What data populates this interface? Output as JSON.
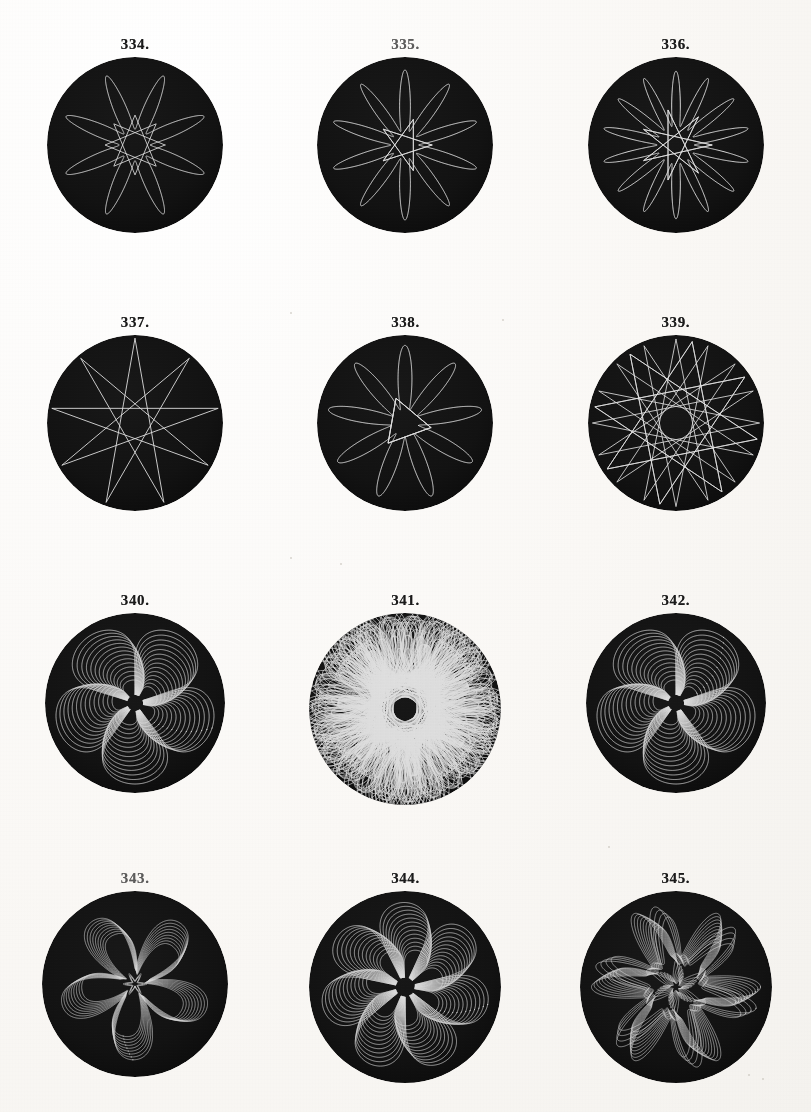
{
  "plate": {
    "title": "Plate of geometric chuck turned patterns, figures 334 to 345",
    "paper_color": "#fbfaf7",
    "ink_color": "#1b1b1b",
    "disc_color": "#171413",
    "line_color": "#e8e5dd",
    "columns": 3,
    "rows": 4
  },
  "figures": [
    {
      "label": "334.",
      "number": 334,
      "row": 1,
      "col": 1,
      "disc_diameter": 176,
      "pattern": "rosette",
      "petals": 8,
      "inner_ratio": 0.2,
      "petal_width": 0.36,
      "line_width": 1.0,
      "copies": 1,
      "copy_offset": 0,
      "rotation": 0,
      "outer_ratio": 0.92,
      "faded_label": false
    },
    {
      "label": "335.",
      "number": 335,
      "row": 1,
      "col": 2,
      "disc_diameter": 176,
      "pattern": "rosette",
      "petals": 10,
      "inner_ratio": 0.18,
      "petal_width": 0.3,
      "line_width": 1.0,
      "copies": 1,
      "copy_offset": 0,
      "rotation": 0,
      "outer_ratio": 0.92,
      "faded_label": true
    },
    {
      "label": "336.",
      "number": 336,
      "row": 1,
      "col": 3,
      "disc_diameter": 176,
      "pattern": "rosette",
      "petals": 14,
      "inner_ratio": 0.24,
      "petal_width": 0.24,
      "line_width": 1.0,
      "copies": 1,
      "copy_offset": 0,
      "rotation": 0,
      "outer_ratio": 0.92,
      "faded_label": false
    },
    {
      "label": "337.",
      "number": 337,
      "row": 2,
      "col": 1,
      "disc_diameter": 176,
      "pattern": "star",
      "points": 9,
      "inner_ratio": 0.13,
      "petal_width": 0.07,
      "line_width": 0.9,
      "copies": 1,
      "copy_offset": 0,
      "rotation": 0,
      "outer_ratio": 0.96,
      "faded_label": false
    },
    {
      "label": "338.",
      "number": 338,
      "row": 2,
      "col": 2,
      "disc_diameter": 176,
      "pattern": "rosette",
      "petals": 9,
      "inner_ratio": 0.17,
      "petal_width": 0.16,
      "line_width": 1.0,
      "copies": 1,
      "copy_offset": 0,
      "rotation": 10,
      "outer_ratio": 0.95,
      "faded_label": false
    },
    {
      "label": "339.",
      "number": 339,
      "row": 2,
      "col": 3,
      "disc_diameter": 176,
      "pattern": "star",
      "points": 16,
      "inner_ratio": 0.19,
      "petal_width": 0.05,
      "line_width": 0.85,
      "copies": 1,
      "copy_offset": 0,
      "rotation": 0,
      "outer_ratio": 0.95,
      "faded_label": false
    },
    {
      "label": "340.",
      "number": 340,
      "row": 3,
      "col": 1,
      "disc_diameter": 180,
      "pattern": "spiral-lobe",
      "petals": 5,
      "inner_ratio": 0.1,
      "petal_width": 0.52,
      "line_width": 0.75,
      "copies": 14,
      "copy_offset": 2.2,
      "rotation": 18,
      "outer_ratio": 0.9,
      "faded_label": false
    },
    {
      "label": "341.",
      "number": 341,
      "row": 3,
      "col": 2,
      "disc_diameter": 192,
      "pattern": "dense-rose",
      "petals": 17,
      "inner_ratio": 0.07,
      "petal_width": 0.62,
      "line_width": 0.7,
      "copies": 17,
      "copy_offset": 0,
      "rotation": 0,
      "outer_ratio": 0.88,
      "faded_label": false
    },
    {
      "label": "342.",
      "number": 342,
      "row": 3,
      "col": 3,
      "disc_diameter": 180,
      "pattern": "spiral-lobe",
      "petals": 5,
      "inner_ratio": 0.1,
      "petal_width": 0.52,
      "line_width": 0.75,
      "copies": 14,
      "copy_offset": 2.2,
      "rotation": -54,
      "outer_ratio": 0.9,
      "faded_label": false
    },
    {
      "label": "343.",
      "number": 343,
      "row": 4,
      "col": 1,
      "disc_diameter": 186,
      "pattern": "knot",
      "petals": 5,
      "inner_ratio": 0.13,
      "petal_width": 0.46,
      "line_width": 0.65,
      "copies": 9,
      "copy_offset": 1.4,
      "rotation": 90,
      "outer_ratio": 0.86,
      "faded_label": true
    },
    {
      "label": "344.",
      "number": 344,
      "row": 4,
      "col": 2,
      "disc_diameter": 192,
      "pattern": "pinwheel",
      "petals": 7,
      "inner_ratio": 0.11,
      "petal_width": 0.34,
      "line_width": 0.7,
      "copies": 13,
      "copy_offset": 2.0,
      "rotation": 12,
      "outer_ratio": 0.88,
      "faded_label": false
    },
    {
      "label": "345.",
      "number": 345,
      "row": 4,
      "col": 3,
      "disc_diameter": 192,
      "pattern": "ornament",
      "petals": 6,
      "inner_ratio": 0.09,
      "petal_width": 0.4,
      "line_width": 0.62,
      "copies": 10,
      "copy_offset": 1.6,
      "rotation": 0,
      "outer_ratio": 0.88,
      "faded_label": false
    }
  ],
  "specks": [
    {
      "x": 290,
      "y": 312,
      "size": 2
    },
    {
      "x": 502,
      "y": 319,
      "size": 2
    },
    {
      "x": 290,
      "y": 557,
      "size": 2
    },
    {
      "x": 340,
      "y": 563,
      "size": 2
    },
    {
      "x": 748,
      "y": 1074,
      "size": 2
    },
    {
      "x": 762,
      "y": 1078,
      "size": 2
    },
    {
      "x": 608,
      "y": 846,
      "size": 2
    }
  ]
}
